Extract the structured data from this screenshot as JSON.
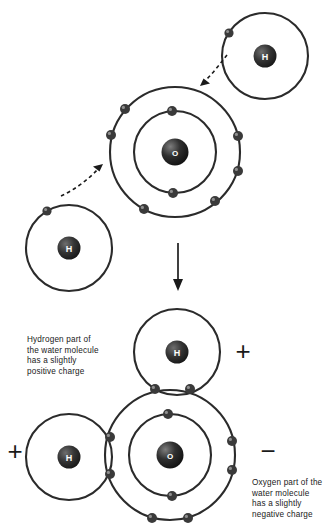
{
  "figure": {
    "domain": "diagram",
    "background_color": "#ffffff",
    "stroke_color": "#2b2b2b",
    "nucleus_color": "#2e2e2e",
    "electron_color": "#3a3a3a",
    "text_color": "#1a1a1a"
  },
  "labels": {
    "hydrogen_symbol": "H",
    "oxygen_symbol": "O"
  },
  "captions": {
    "hydrogen_charge_note": "Hydrogen part of\nthe water molecule\nhas a slightly\npositive charge",
    "oxygen_charge_note": "Oxygen part of the\nwater molecule\nhas a slightly\nnegative charge"
  },
  "charges": {
    "top_right": "+",
    "left": "+",
    "right": "−"
  },
  "top_panel": {
    "description": "Two separate hydrogen atoms approaching a central oxygen atom",
    "atoms": [
      {
        "name": "hydrogen-top-right",
        "symbol": "H",
        "nucleus": {
          "cx": 265,
          "cy": 56,
          "r": 11.5
        },
        "shells": [
          {
            "r": 43,
            "electrons": 1
          }
        ],
        "electrons": [
          {
            "cx": 229,
            "cy": 33,
            "r": 4.6
          }
        ]
      },
      {
        "name": "oxygen-center",
        "symbol": "O",
        "nucleus": {
          "cx": 175,
          "cy": 152,
          "r": 13.5
        },
        "shells": [
          {
            "r": 41,
            "electrons": 2
          },
          {
            "r": 65,
            "electrons": 6
          }
        ],
        "inner_electrons": [
          {
            "cx": 172,
            "cy": 111,
            "r": 5.0
          },
          {
            "cx": 173,
            "cy": 193,
            "r": 5.0
          }
        ],
        "outer_electrons": [
          {
            "cx": 125,
            "cy": 109,
            "r": 5.0
          },
          {
            "cx": 111,
            "cy": 135,
            "r": 5.0
          },
          {
            "cx": 144,
            "cy": 209,
            "r": 5.0
          },
          {
            "cx": 238,
            "cy": 136,
            "r": 5.0
          },
          {
            "cx": 238,
            "cy": 171,
            "r": 5.0
          },
          {
            "cx": 215,
            "cy": 201,
            "r": 5.0
          }
        ]
      },
      {
        "name": "hydrogen-bottom-left",
        "symbol": "H",
        "nucleus": {
          "cx": 69,
          "cy": 248,
          "r": 11.5
        },
        "shells": [
          {
            "r": 43,
            "electrons": 1
          }
        ],
        "electrons": [
          {
            "cx": 47,
            "cy": 211,
            "r": 4.6
          }
        ]
      }
    ],
    "arrows": [
      {
        "name": "electron-share-arrow-lower-left",
        "style": "dashed",
        "direction": "up-right"
      },
      {
        "name": "electron-share-arrow-upper-right",
        "style": "dashed",
        "direction": "down-left"
      }
    ]
  },
  "transition": {
    "name": "downward-transition-arrow",
    "style": "solid",
    "direction": "down"
  },
  "bottom_panel": {
    "description": "Formed water molecule: one oxygen atom bonded to two hydrogen atoms with shared electron pairs",
    "atoms": [
      {
        "name": "hydrogen-top",
        "symbol": "H",
        "nucleus": {
          "cx": 177,
          "cy": 352,
          "r": 11.5
        },
        "shells": [
          {
            "r": 43,
            "electrons": 2
          }
        ],
        "shared_electrons": [
          {
            "cx": 155,
            "cy": 389,
            "r": 5.0
          },
          {
            "cx": 190,
            "cy": 389,
            "r": 5.0
          }
        ]
      },
      {
        "name": "hydrogen-left",
        "symbol": "H",
        "nucleus": {
          "cx": 69,
          "cy": 457,
          "r": 11.5
        },
        "shells": [
          {
            "r": 43,
            "electrons": 2
          }
        ],
        "shared_electrons": [
          {
            "cx": 110,
            "cy": 437,
            "r": 5.0
          },
          {
            "cx": 110,
            "cy": 474,
            "r": 5.0
          }
        ]
      },
      {
        "name": "oxygen-bottom",
        "symbol": "O",
        "nucleus": {
          "cx": 170,
          "cy": 455,
          "r": 13.5
        },
        "shells": [
          {
            "r": 41,
            "electrons": 2
          },
          {
            "r": 65,
            "electrons": 8
          }
        ],
        "inner_electrons": [
          {
            "cx": 168,
            "cy": 414,
            "r": 5.0
          },
          {
            "cx": 172,
            "cy": 496,
            "r": 5.0
          }
        ],
        "outer_electrons": [
          {
            "cx": 232,
            "cy": 441,
            "r": 5.0
          },
          {
            "cx": 232,
            "cy": 470,
            "r": 5.0
          },
          {
            "cx": 152,
            "cy": 518,
            "r": 5.0
          },
          {
            "cx": 188,
            "cy": 518,
            "r": 5.0
          }
        ]
      }
    ]
  }
}
